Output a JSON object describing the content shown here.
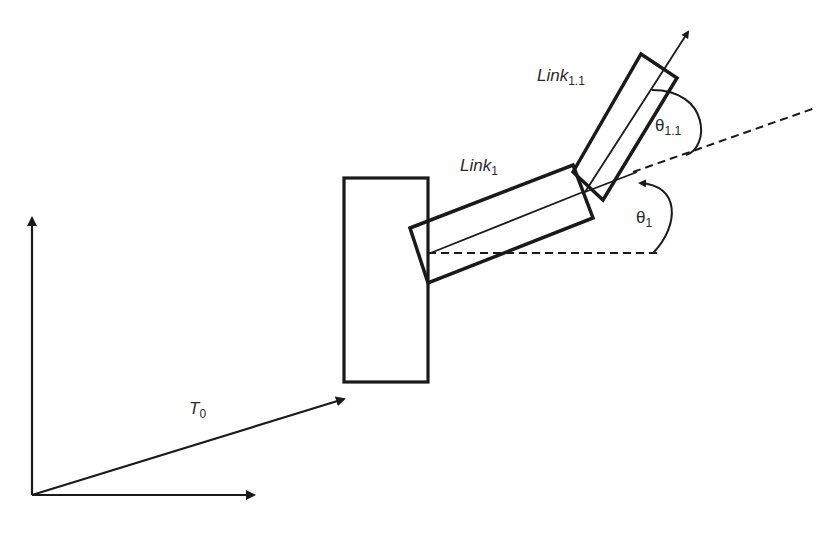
{
  "diagram": {
    "type": "kinematic-chain",
    "labels": {
      "link1_main": "Link",
      "link1_sub": "1",
      "link11_main": "Link",
      "link11_sub": "1.1",
      "theta1_main": "θ",
      "theta1_sub": "1",
      "theta11_main": "θ",
      "theta11_sub": "1.1",
      "t0_main": "T",
      "t0_sub": "0"
    },
    "colors": {
      "stroke": "#1a1a1a",
      "background": "#ffffff"
    },
    "elements": [
      "world-frame-axes",
      "base-block",
      "transform-vector-T0",
      "link-1",
      "link-1.1",
      "angle-theta-1",
      "angle-theta-1.1"
    ]
  }
}
